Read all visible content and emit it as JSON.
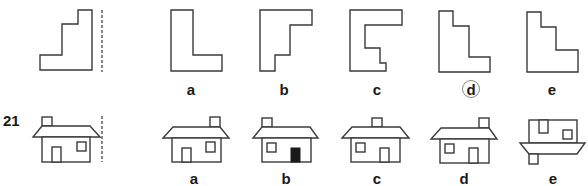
{
  "questions": [
    {
      "number": "",
      "prompt_shape": "staircase-l-shape",
      "options": [
        {
          "label": "a",
          "shape": "l-shape"
        },
        {
          "label": "b",
          "shape": "stepped-reverse-l"
        },
        {
          "label": "c",
          "shape": "notched-bracket"
        },
        {
          "label": "d",
          "shape": "staircase-mirror",
          "circled": true
        },
        {
          "label": "e",
          "shape": "staircase-mirror-variant"
        }
      ]
    },
    {
      "number": "21",
      "prompt_shape": "house-chimney-left",
      "options": [
        {
          "label": "a",
          "shape": "house-chimney-right"
        },
        {
          "label": "b",
          "shape": "house-black-door"
        },
        {
          "label": "c",
          "shape": "house-chimney-center"
        },
        {
          "label": "d",
          "shape": "house-mirror"
        },
        {
          "label": "e",
          "shape": "house-upside-down"
        }
      ]
    }
  ],
  "colors": {
    "line": "#3a3a3a",
    "fill_solid": "#1a1a1a",
    "circle": "#888888"
  }
}
